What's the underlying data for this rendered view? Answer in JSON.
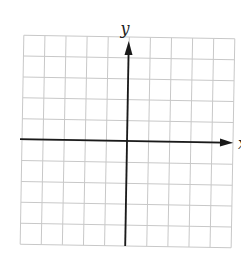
{
  "chart_data": {
    "type": "coordinate-grid",
    "title": "",
    "xlabel": "x",
    "ylabel": "y",
    "grid": true,
    "grid_cells": {
      "columns": 10,
      "rows": 10
    },
    "xlim": [
      -5,
      5
    ],
    "ylim": [
      -5,
      5
    ],
    "tick_labels": [],
    "series": []
  },
  "labels": {
    "y_axis": "y",
    "x_axis": "x"
  },
  "colors": {
    "grid": "#c8c8c8",
    "axis": "#1a1a1a",
    "background": "#ffffff"
  }
}
